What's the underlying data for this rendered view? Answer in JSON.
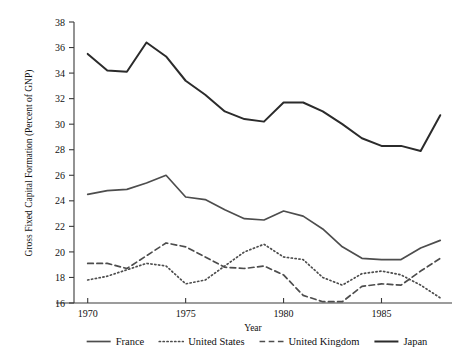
{
  "chart_data": {
    "type": "line",
    "title": "",
    "xlabel": "Year",
    "ylabel": "Gross Fixed Capital Formation (Percent of GNP)",
    "xlim": [
      1969.3,
      1988.6
    ],
    "ylim": [
      16,
      38
    ],
    "xticks": [
      1970,
      1975,
      1980,
      1985
    ],
    "xtick_labels": [
      "1970",
      "1975",
      "1980",
      "1985"
    ],
    "yticks": [
      16,
      18,
      20,
      22,
      24,
      26,
      28,
      30,
      32,
      34,
      36,
      38
    ],
    "ytick_labels": [
      "16",
      "18",
      "20",
      "22",
      "24",
      "26",
      "28",
      "30",
      "32",
      "34",
      "36",
      "38"
    ],
    "grid": false,
    "legend_position": "bottom",
    "x": [
      1970,
      1971,
      1972,
      1973,
      1974,
      1975,
      1976,
      1977,
      1978,
      1979,
      1980,
      1981,
      1982,
      1983,
      1984,
      1985,
      1986,
      1987,
      1988
    ],
    "series": [
      {
        "name": "France",
        "style": "solid",
        "color": "#4d4d4d",
        "width": 1.7,
        "values": [
          24.5,
          24.8,
          24.9,
          25.4,
          26.0,
          24.3,
          24.1,
          23.3,
          22.6,
          22.5,
          23.2,
          22.8,
          21.8,
          20.4,
          19.5,
          19.4,
          19.4,
          20.3,
          20.9
        ]
      },
      {
        "name": "United States",
        "style": "dotted",
        "color": "#4d4d4d",
        "width": 1.7,
        "values": [
          17.8,
          18.1,
          18.6,
          19.1,
          18.9,
          17.5,
          17.8,
          18.9,
          20.0,
          20.6,
          19.6,
          19.4,
          18.0,
          17.4,
          18.3,
          18.5,
          18.2,
          17.4,
          16.4
        ]
      },
      {
        "name": "United Kingdom",
        "style": "dashed",
        "color": "#4d4d4d",
        "width": 1.7,
        "values": [
          19.1,
          19.1,
          18.7,
          19.7,
          20.7,
          20.4,
          19.6,
          18.8,
          18.7,
          18.9,
          18.2,
          16.6,
          16.1,
          16.1,
          17.3,
          17.5,
          17.4,
          18.5,
          19.5
        ]
      },
      {
        "name": "Japan",
        "style": "solid",
        "color": "#2b2b2b",
        "width": 2.0,
        "values": [
          35.5,
          34.2,
          34.1,
          36.4,
          35.3,
          33.4,
          32.3,
          31.0,
          30.4,
          30.2,
          31.7,
          31.7,
          31.0,
          30.0,
          28.9,
          28.3,
          28.3,
          27.9,
          30.7
        ]
      }
    ]
  },
  "legend": {
    "entries": [
      {
        "label": "France",
        "style": "solid",
        "width": 1.7,
        "color": "#4d4d4d"
      },
      {
        "label": "United States",
        "style": "dotted",
        "width": 1.7,
        "color": "#4d4d4d"
      },
      {
        "label": "United Kingdom",
        "style": "dashed",
        "width": 1.7,
        "color": "#4d4d4d"
      },
      {
        "label": "Japan",
        "style": "solid",
        "width": 2.0,
        "color": "#2b2b2b"
      }
    ]
  }
}
